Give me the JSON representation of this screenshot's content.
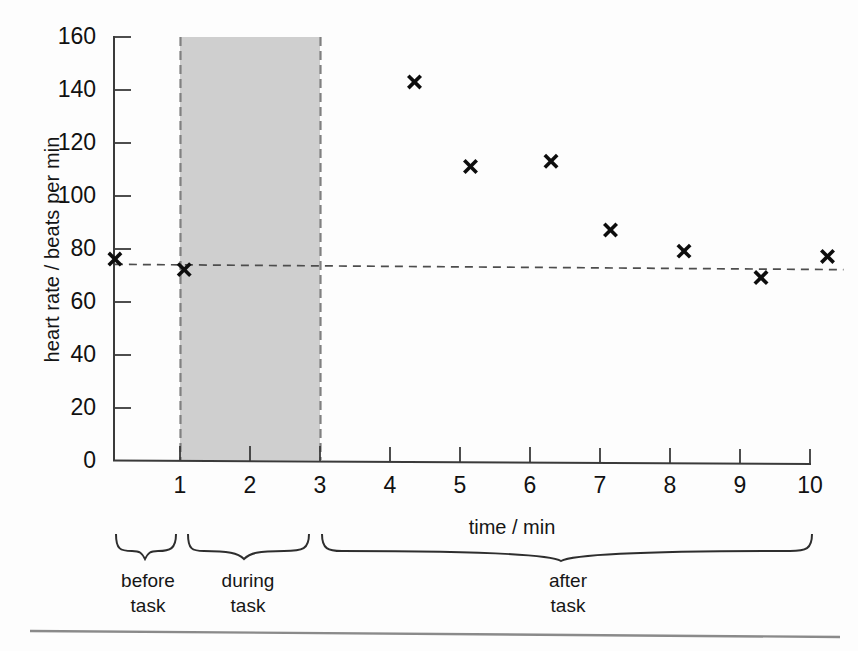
{
  "chart_data": {
    "type": "scatter",
    "title": "",
    "xlabel": "time / min",
    "ylabel": "heart rate / beats per min",
    "xlim": [
      0,
      10.6
    ],
    "ylim": [
      0,
      160
    ],
    "x_ticks": [
      1,
      2,
      3,
      4,
      5,
      6,
      7,
      8,
      9,
      10
    ],
    "y_ticks": [
      0,
      20,
      40,
      60,
      80,
      100,
      120,
      140,
      160
    ],
    "grid": false,
    "legend": "none",
    "series": [
      {
        "name": "heart rate",
        "marker": "x",
        "x": [
          0.07,
          1.06,
          4.35,
          5.15,
          6.3,
          7.15,
          8.2,
          9.3,
          10.25
        ],
        "values": [
          76,
          72,
          143,
          111,
          113,
          87,
          79,
          69,
          77
        ]
      }
    ],
    "annotations": {
      "resting_line": {
        "label": "resting heart rate reference",
        "style": "dashed",
        "y_start": 74,
        "y_end": 72,
        "x_start": 0.07,
        "x_end": 10.25
      },
      "shaded_region": {
        "label": "during task",
        "x_start": 1,
        "x_end": 3,
        "y_start": 0,
        "y_end": 160,
        "fill": "#cfcfcf",
        "border": "dashed"
      }
    }
  },
  "axis": {
    "y_tick_labels": [
      "160",
      "140",
      "120",
      "100",
      "80",
      "60",
      "40",
      "20",
      "0"
    ],
    "x_tick_labels": [
      "1",
      "2",
      "3",
      "4",
      "5",
      "6",
      "7",
      "8",
      "9",
      "10"
    ],
    "y_title": "heart rate / beats per min",
    "x_title": "time / min"
  },
  "phases": [
    {
      "name": "before-task",
      "line1": "before",
      "line2": "task"
    },
    {
      "name": "during-task",
      "line1": "during",
      "line2": "task"
    },
    {
      "name": "after-task",
      "line1": "after",
      "line2": "task"
    }
  ],
  "colors": {
    "axis": "#3a3a3a",
    "marker": "#0d0d0d",
    "shade_fill": "#cccccc",
    "shade_border": "#7d7d7d",
    "dash_line": "#4d4d4d",
    "rule": "#8a8a8a",
    "text": "#151515"
  }
}
